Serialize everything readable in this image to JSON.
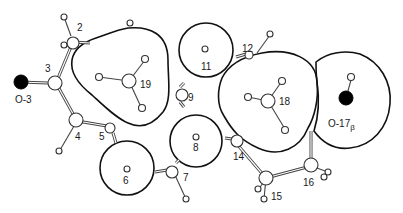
{
  "figure": {
    "labels": {
      "c2": "2",
      "c3": "3",
      "o3": "O-3",
      "c4": "4",
      "c5": "5",
      "c6": "6",
      "c7": "7",
      "c8": "8",
      "c9": "9",
      "c11": "11",
      "c12": "12",
      "c14": "14",
      "c15": "15",
      "c16": "16",
      "c18": "18",
      "c19": "19",
      "o17": "O-17",
      "o17_sub": "β"
    },
    "colors": {
      "outline": "#111111",
      "bond": "#444444",
      "oxygen": "#000000",
      "atom_fill": "#ffffff"
    }
  }
}
